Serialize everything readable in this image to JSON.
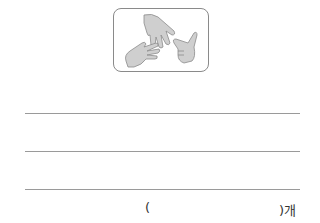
{
  "figure": {
    "icons": [
      "paper-hand-icon",
      "paper-hand-icon",
      "scissors-hand-icon"
    ]
  },
  "answer_lines": 3,
  "answer": {
    "open_paren": "(",
    "close_paren_unit": ")개"
  }
}
